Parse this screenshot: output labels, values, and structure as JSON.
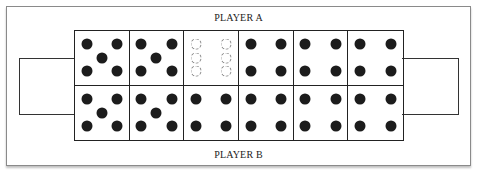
{
  "labels": {
    "top": "PLAYER A",
    "bottom": "PLAYER B"
  },
  "stores": {
    "left": {
      "seeds": 0
    },
    "right": {
      "seeds": 0
    }
  },
  "rows": {
    "top": [
      {
        "pit": 1,
        "seeds": 5,
        "style": "solid"
      },
      {
        "pit": 2,
        "seeds": 5,
        "style": "solid"
      },
      {
        "pit": 3,
        "seeds": 6,
        "style": "ghost"
      },
      {
        "pit": 4,
        "seeds": 4,
        "style": "solid"
      },
      {
        "pit": 5,
        "seeds": 4,
        "style": "solid"
      },
      {
        "pit": 6,
        "seeds": 4,
        "style": "solid"
      }
    ],
    "bottom": [
      {
        "pit": 1,
        "seeds": 5,
        "style": "solid"
      },
      {
        "pit": 2,
        "seeds": 5,
        "style": "solid"
      },
      {
        "pit": 3,
        "seeds": 4,
        "style": "solid"
      },
      {
        "pit": 4,
        "seeds": 4,
        "style": "solid"
      },
      {
        "pit": 5,
        "seeds": 4,
        "style": "solid"
      },
      {
        "pit": 6,
        "seeds": 4,
        "style": "solid"
      }
    ]
  },
  "colors": {
    "seed": "#1c1c1c",
    "ghost_seed": "#888888",
    "line": "#222222"
  }
}
